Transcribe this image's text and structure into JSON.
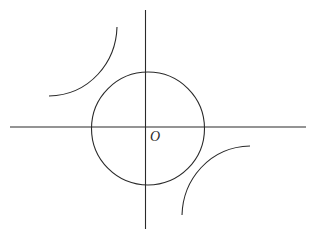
{
  "diagram": {
    "title": "",
    "stroke_color": "#2a2a2a",
    "background_color": "#ffffff",
    "labels": {
      "origin": "O"
    },
    "axes": {
      "x_axis": {
        "x1": 10,
        "y1": 127,
        "x2": 306,
        "y2": 127
      },
      "y_axis": {
        "x1": 145.5,
        "y1": 10,
        "x2": 145.5,
        "y2": 229
      }
    },
    "circle": {
      "cx": 148,
      "cy": 128.5,
      "r": 56.5
    },
    "hyperbola_branches": [
      {
        "quadrant": "II",
        "start": [
          117,
          27
        ],
        "end": [
          49,
          96
        ]
      },
      {
        "quadrant": "IV",
        "start": [
          250,
          146
        ],
        "end": [
          182,
          215
        ]
      }
    ]
  }
}
